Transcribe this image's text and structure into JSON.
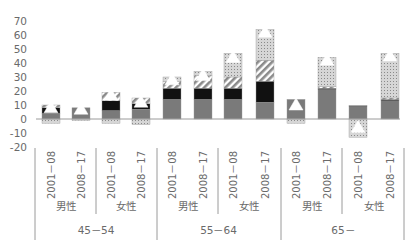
{
  "chart_data": {
    "type": "bar",
    "stacked": true,
    "title": "",
    "xlabel": "",
    "ylabel": "",
    "ylim": [
      -20,
      70
    ],
    "yticks": [
      70,
      60,
      50,
      40,
      30,
      20,
      10,
      0,
      -10,
      -20
    ],
    "grid": false,
    "legend": "none visible",
    "age_groups": [
      "45－54",
      "55－64",
      "65－"
    ],
    "sexes": [
      "男性",
      "女性"
    ],
    "periods": [
      "2001－08",
      "2008－17"
    ],
    "categories": [
      "45－54 男性 2001－08",
      "45－54 男性 2008－17",
      "45－54 女性 2001－08",
      "45－54 女性 2008－17",
      "55－64 男性 2001－08",
      "55－64 男性 2008－17",
      "55－64 女性 2001－08",
      "55－64 女性 2008－17",
      "65－ 男性 2001－08",
      "65－ 男性 2008－17",
      "65－ 女性 2001－08",
      "65－ 女性 2008－17"
    ],
    "series": [
      {
        "name": "component 1 (gray)",
        "pattern": "solid-gray",
        "color": "#7a7a7a",
        "values": [
          4,
          8,
          6,
          7,
          14,
          14,
          14,
          12,
          14,
          21,
          9,
          13
        ]
      },
      {
        "name": "component 2 (black)",
        "pattern": "solid-black",
        "color": "#111111",
        "values": [
          4,
          0,
          7,
          4,
          8,
          8,
          8,
          15,
          0,
          1,
          0.5,
          1
        ]
      },
      {
        "name": "component 3 (hatched)",
        "pattern": "diagonal-hatch",
        "color": "#888888",
        "values": [
          2,
          0,
          6,
          4,
          5,
          9,
          8,
          15,
          0,
          1,
          0,
          1
        ]
      },
      {
        "name": "component 4 (dotted)",
        "pattern": "dotted-grid",
        "color": "#bbbbbb",
        "values": [
          -3,
          -1,
          -3,
          -4,
          3,
          3,
          17,
          22,
          -3,
          21,
          -13,
          32
        ]
      },
      {
        "name": "total (triangle marker)",
        "pattern": "white-triangle",
        "color": "#ffffff",
        "values": [
          8,
          7,
          17,
          12,
          28,
          31,
          44,
          62,
          10,
          42,
          -6,
          45
        ]
      }
    ]
  }
}
